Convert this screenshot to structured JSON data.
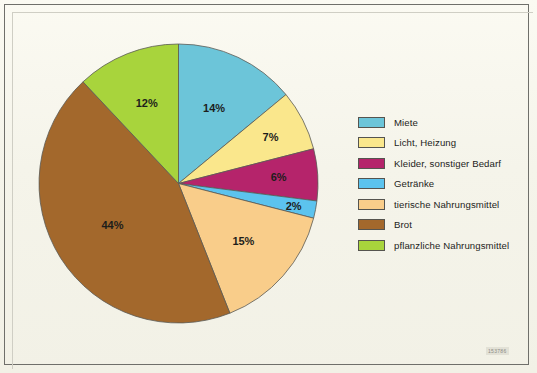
{
  "figure": {
    "background_color": "#f6f5ec",
    "border_color": "#6f6f6a",
    "code": "153786"
  },
  "chart_data": {
    "type": "pie",
    "title": "",
    "subtitle": "",
    "xlabel": "",
    "ylabel": "",
    "grid": false,
    "legend_position": "right",
    "start_angle_deg": 0,
    "direction": "clockwise",
    "total": 100,
    "unit": "%",
    "categories": [
      "Miete",
      "Licht, Heizung",
      "Kleider, sonstiger Bedarf",
      "Getränke",
      "tierische Nahrungsmittel",
      "Brot",
      "pflanzliche Nahrungsmittel"
    ],
    "values": [
      14,
      7,
      6,
      2,
      15,
      44,
      12
    ],
    "data_labels": [
      "14%",
      "7%",
      "6%",
      "2%",
      "15%",
      "44%",
      "12%"
    ],
    "colors": [
      "#6cc5d9",
      "#fae78c",
      "#b5246b",
      "#5cc3ee",
      "#f9cd8a",
      "#a3682c",
      "#a8d43c"
    ],
    "slices": [
      {
        "label": "Miete",
        "value": 14,
        "data_label": "14%",
        "color": "#6cc5d9"
      },
      {
        "label": "Licht, Heizung",
        "value": 7,
        "data_label": "7%",
        "color": "#fae78c"
      },
      {
        "label": "Kleider, sonstiger Bedarf",
        "value": 6,
        "data_label": "6%",
        "color": "#b5246b"
      },
      {
        "label": "Getränke",
        "value": 2,
        "data_label": "2%",
        "color": "#5cc3ee"
      },
      {
        "label": "tierische Nahrungsmittel",
        "value": 15,
        "data_label": "15%",
        "color": "#f9cd8a"
      },
      {
        "label": "Brot",
        "value": 44,
        "data_label": "44%",
        "color": "#a3682c"
      },
      {
        "label": "pflanzliche Nahrungsmittel",
        "value": 12,
        "data_label": "12%",
        "color": "#a8d43c"
      }
    ]
  },
  "legend": {
    "items": [
      {
        "label": "Miete",
        "color": "#6cc5d9"
      },
      {
        "label": "Licht, Heizung",
        "color": "#fae78c"
      },
      {
        "label": "Kleider, sonstiger Bedarf",
        "color": "#b5246b"
      },
      {
        "label": "Getränke",
        "color": "#5cc3ee"
      },
      {
        "label": "tierische Nahrungsmittel",
        "color": "#f9cd8a"
      },
      {
        "label": "Brot",
        "color": "#a3682c"
      },
      {
        "label": "pflanzliche Nahrungsmittel",
        "color": "#a8d43c"
      }
    ]
  }
}
